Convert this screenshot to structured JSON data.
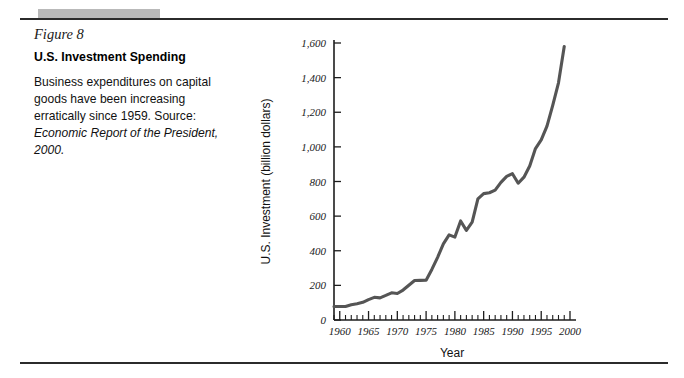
{
  "figure": {
    "number_label": "Figure 8",
    "title": "U.S. Investment Spending",
    "caption_text": "Business expenditures on capital goods have been increasing erratically since 1959. Source: ",
    "caption_source_italic": "Economic Report of the President, 2000."
  },
  "colors": {
    "rule": "#2b2b2b",
    "grey_block": "#b9b9b9",
    "curve": "#555555",
    "axis": "#1d1d1d"
  },
  "chart_data": {
    "type": "line",
    "title": "",
    "xlabel": "Year",
    "ylabel": "U.S. Investment (billion dollars)",
    "xlim": [
      1959,
      2000
    ],
    "ylim": [
      0,
      1600
    ],
    "grid": false,
    "legend": null,
    "x_tick_labels": [
      "1960",
      "1965",
      "1970",
      "1975",
      "1980",
      "1985",
      "1990",
      "1995",
      "2000"
    ],
    "x_tick_values": [
      1960,
      1965,
      1970,
      1975,
      1980,
      1985,
      1990,
      1995,
      2000
    ],
    "x_minor_tick_step": 1,
    "y_tick_labels": [
      "0",
      "200",
      "400",
      "600",
      "800",
      "1,000",
      "1,200",
      "1,400",
      "1,600"
    ],
    "y_tick_values": [
      0,
      200,
      400,
      600,
      800,
      1000,
      1200,
      1400,
      1600
    ],
    "series": [
      {
        "name": "U.S. Investment",
        "x": [
          1959,
          1960,
          1961,
          1962,
          1963,
          1964,
          1965,
          1966,
          1967,
          1968,
          1969,
          1970,
          1971,
          1972,
          1973,
          1974,
          1975,
          1976,
          1977,
          1978,
          1979,
          1980,
          1981,
          1982,
          1983,
          1984,
          1985,
          1986,
          1987,
          1988,
          1989,
          1990,
          1991,
          1992,
          1993,
          1994,
          1995,
          1996,
          1997,
          1998,
          1999
        ],
        "values": [
          78,
          78,
          78,
          88,
          94,
          102,
          118,
          131,
          128,
          142,
          157,
          153,
          173,
          201,
          228,
          229,
          230,
          292,
          362,
          440,
          492,
          479,
          572,
          518,
          565,
          700,
          730,
          735,
          750,
          795,
          830,
          845,
          790,
          825,
          890,
          990,
          1040,
          1120,
          1240,
          1370,
          1580
        ]
      }
    ]
  }
}
